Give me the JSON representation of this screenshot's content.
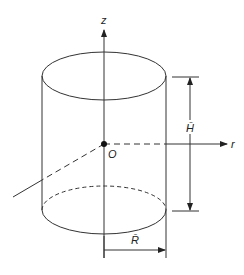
{
  "diagram": {
    "type": "cylinder-coordinate-system",
    "labels": {
      "z_axis": "z",
      "r_axis": "r",
      "origin": "O",
      "height": "H̄",
      "radius": "R̄"
    },
    "colors": {
      "line": "#333333",
      "background": "#ffffff",
      "text": "#222222"
    }
  }
}
